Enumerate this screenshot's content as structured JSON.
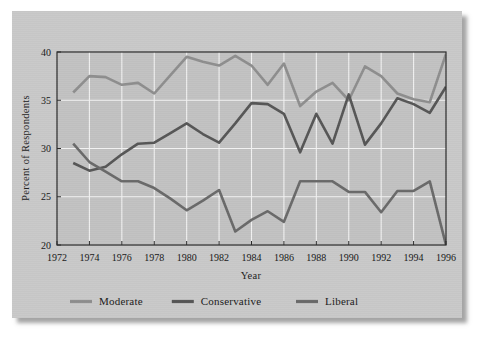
{
  "figure": {
    "background_color": "#c9c9c9",
    "plot_background_color": "#c2c2c2"
  },
  "chart_data": {
    "type": "line",
    "title": "",
    "xlabel": "Year",
    "ylabel": "Percent of Respondents",
    "xlim": [
      1972,
      1996
    ],
    "ylim": [
      20,
      40
    ],
    "xticks": [
      1972,
      1974,
      1976,
      1978,
      1980,
      1982,
      1984,
      1986,
      1988,
      1990,
      1992,
      1994,
      1996
    ],
    "yticks": [
      20,
      25,
      30,
      35,
      40
    ],
    "grid": true,
    "grid_color": "#f2f2f2",
    "legend_position": "below",
    "x": [
      1973,
      1974,
      1975,
      1976,
      1977,
      1978,
      1979,
      1980,
      1981,
      1982,
      1983,
      1984,
      1985,
      1986,
      1987,
      1988,
      1989,
      1990,
      1991,
      1992,
      1993,
      1994,
      1995,
      1996
    ],
    "series": [
      {
        "name": "Moderate",
        "color": "#8e8e8e",
        "values": [
          35.8,
          37.5,
          37.4,
          36.6,
          36.8,
          35.7,
          37.6,
          39.5,
          39.0,
          38.6,
          39.6,
          38.6,
          36.6,
          38.8,
          34.4,
          35.9,
          36.8,
          35.0,
          38.5,
          37.5,
          35.7,
          35.1,
          34.8,
          39.8
        ]
      },
      {
        "name": "Conservative",
        "color": "#565656",
        "values": [
          28.5,
          27.7,
          28.1,
          29.4,
          30.5,
          30.6,
          31.6,
          32.6,
          31.5,
          30.6,
          32.6,
          34.7,
          34.6,
          33.6,
          29.6,
          33.6,
          30.5,
          35.6,
          30.4,
          32.6,
          35.2,
          34.6,
          33.7,
          36.4
        ]
      },
      {
        "name": "Liberal",
        "color": "#6a6a6a",
        "values": [
          30.5,
          28.6,
          27.6,
          26.6,
          26.6,
          25.9,
          24.8,
          23.6,
          24.6,
          25.7,
          21.4,
          22.6,
          23.5,
          22.4,
          26.6,
          26.6,
          26.6,
          25.5,
          25.5,
          23.4,
          25.6,
          25.6,
          26.6,
          20.0
        ]
      }
    ]
  },
  "legend": {
    "items": [
      {
        "label": "Moderate",
        "color": "#8e8e8e"
      },
      {
        "label": "Conservative",
        "color": "#565656"
      },
      {
        "label": "Liberal",
        "color": "#6a6a6a"
      }
    ]
  },
  "axis": {
    "y_title": "Percent of Respondents",
    "x_title": "Year"
  }
}
